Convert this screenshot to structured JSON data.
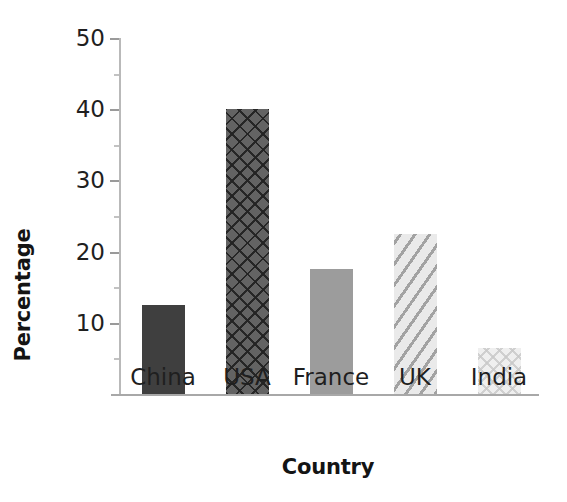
{
  "chart_data": {
    "type": "bar",
    "title": "",
    "xlabel": "Country",
    "ylabel": "Percentage",
    "categories": [
      "China",
      "USA",
      "France",
      "UK",
      "India"
    ],
    "values": [
      12.5,
      40,
      17.5,
      22.5,
      6.5
    ],
    "series": [
      {
        "name": "Percentage",
        "values": [
          12.5,
          40,
          17.5,
          22.5,
          6.5
        ]
      }
    ],
    "ylim": [
      0,
      50
    ],
    "xlim_categorical": true,
    "y_ticks": [
      10,
      20,
      30,
      40,
      50
    ],
    "y_tick_labels": [
      "10",
      "20",
      "30",
      "40",
      "50"
    ],
    "y_minor_ticks": [
      5,
      15,
      25,
      35,
      45
    ],
    "grid": false,
    "legend": null,
    "legend_position": "none",
    "annotations": [],
    "bar_styles": [
      {
        "category": "China",
        "fill": "solid",
        "color": "#3f3f3f"
      },
      {
        "category": "USA",
        "fill": "crosshatch",
        "color": "#636363"
      },
      {
        "category": "France",
        "fill": "solid",
        "color": "#9c9c9c"
      },
      {
        "category": "UK",
        "fill": "diagonal",
        "color": "#eaeaea"
      },
      {
        "category": "India",
        "fill": "speckle",
        "color": "#efefef"
      }
    ],
    "axis_color": "#b0b0b0",
    "text_color": "#1a1a1a",
    "background": "#ffffff"
  }
}
